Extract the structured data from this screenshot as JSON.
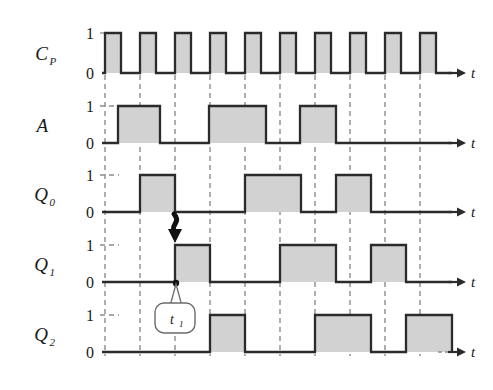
{
  "figure": {
    "type": "timing-diagram",
    "background": "#ffffff",
    "stroke_color": "#2b2b2b",
    "fill_color": "#d2d2d2",
    "grid_color": "#8c8c8c",
    "time_axis_label": "t",
    "level_high_label": "1",
    "level_low_label": "0",
    "annotation": {
      "callout_label": "t",
      "callout_sub": "1",
      "arrow_name": "causality-arrow"
    }
  },
  "geometry": {
    "x_start": 105,
    "period": 35,
    "pulse_width": 16,
    "axis_end": 452,
    "arrow_tip": 466,
    "label_x": 48,
    "digit_x": 90,
    "rows_y0": [
      73,
      143,
      212,
      282,
      352
    ],
    "rows_y1": [
      33,
      106,
      175,
      245,
      315
    ]
  },
  "chart_data": {
    "type": "line",
    "title": "",
    "xlabel": "t",
    "ylabel": "",
    "grid": true,
    "legend_position": "left",
    "x_unit": "clock period",
    "num_periods": 10,
    "signals": [
      {
        "name": "C_P",
        "label": "C",
        "sub": "P",
        "row": 0,
        "kind": "clock",
        "initial": 0,
        "description": "Clock pulse train, 10 pulses, rising edges at each grid line"
      },
      {
        "name": "A",
        "label": "A",
        "sub": "",
        "row": 1,
        "kind": "level",
        "initial": 0,
        "transitions": [
          118,
          160,
          209,
          266,
          300,
          336
        ],
        "description": "Input A toggling: high 118-160, 209-266, 300-336"
      },
      {
        "name": "Q_0",
        "label": "Q",
        "sub": "0",
        "row": 2,
        "kind": "level",
        "initial": 0,
        "transitions": [
          140,
          175,
          245,
          301,
          336,
          371
        ],
        "description": "Q0 output: high 140-175, 245-301, 336-371"
      },
      {
        "name": "Q_1",
        "label": "Q",
        "sub": "1",
        "row": 3,
        "kind": "level",
        "initial": 0,
        "transitions": [
          175,
          210,
          280,
          336,
          371,
          406
        ],
        "description": "Q1 output: high 175-210, 280-336, 371-406"
      },
      {
        "name": "Q_2",
        "label": "Q",
        "sub": "2",
        "row": 4,
        "kind": "level",
        "initial": 0,
        "transitions": [
          210,
          245,
          315,
          371,
          406,
          452
        ],
        "description": "Q2 output: high 210-245, 315-371, 406-452"
      }
    ]
  }
}
